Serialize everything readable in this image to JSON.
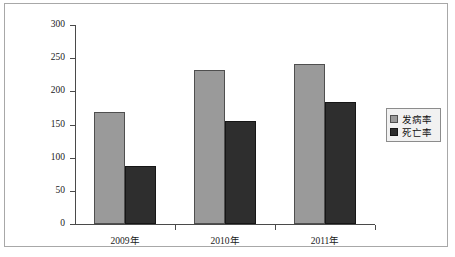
{
  "chart_data": {
    "type": "bar",
    "title": "",
    "subtitle": "",
    "xlabel": "",
    "ylabel": "",
    "categories": [
      "2009年",
      "2010年",
      "2011年"
    ],
    "series": [
      {
        "name": "发病率",
        "color": "#9a9a9a",
        "values": [
          169,
          232,
          241
        ]
      },
      {
        "name": "死亡率",
        "color": "#2e2e2e",
        "values": [
          87,
          155,
          184
        ]
      }
    ],
    "ylim": [
      0,
      300
    ],
    "y_ticks": [
      0,
      50,
      100,
      150,
      200,
      250,
      300
    ],
    "y_tick_labels": [
      "0",
      "50",
      "100",
      "150",
      "200",
      "250",
      "300"
    ],
    "grid": false,
    "legend_position": "right",
    "legend_entries": [
      "发病率",
      "死亡率"
    ]
  },
  "frame": {
    "border_color": "#a8a8a8",
    "background": "#ffffff"
  },
  "axis": {
    "line_color": "#4a4a4a"
  }
}
